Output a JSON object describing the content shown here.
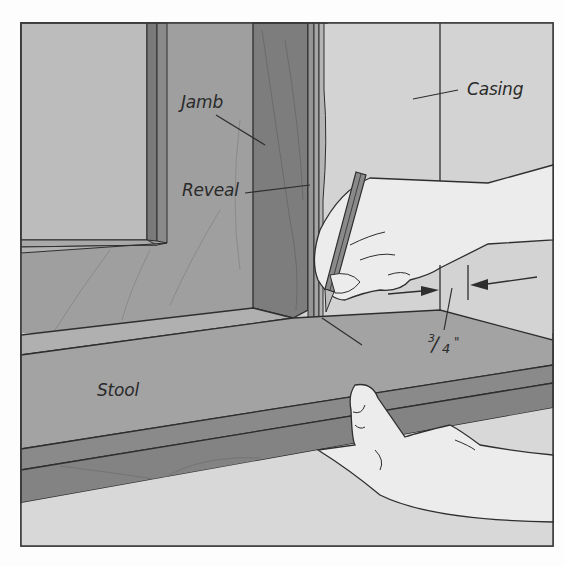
{
  "figure": {
    "type": "technical-illustration",
    "colors": {
      "background": "#fdfdfd",
      "frame_border": "#3a3a3a",
      "glass": "#b9b9b9",
      "sash": "#a7a7a7",
      "jamb_dark": "#7c7c7c",
      "jamb_mid": "#8f8f8f",
      "casing": "#d2d2d2",
      "stool_top": "#a2a2a2",
      "stool_edge": "#858585",
      "hand": "#ececec",
      "floor": "#d6d6d6",
      "line": "#2e2e2e"
    }
  },
  "labels": {
    "jamb": "Jamb",
    "reveal": "Reveal",
    "casing": "Casing",
    "stool": "Stool",
    "dimension": {
      "numerator": "3",
      "denominator": "4",
      "unit": "\""
    }
  }
}
